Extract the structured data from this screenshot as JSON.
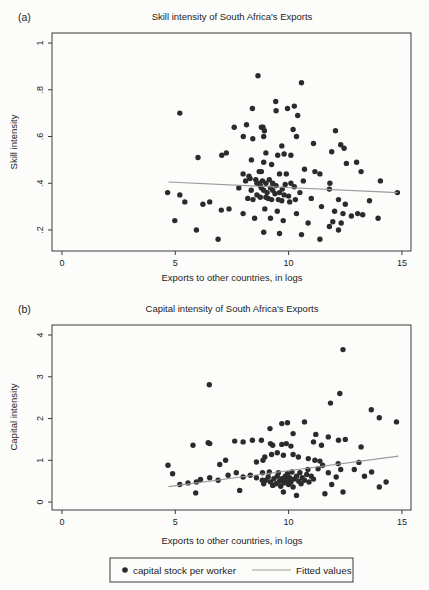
{
  "legend": {
    "marker_label": "capital stock per worker",
    "line_label": "Fitted values"
  },
  "colors": {
    "dot": "#2b2b2b",
    "fitted_line": "#9a9a9a",
    "axis": "#3a3a3a",
    "text": "#1c1c1c",
    "background": "#fcfcfb"
  },
  "chart_data": [
    {
      "type": "scatter",
      "panel_label": "(a)",
      "title": "Skill intensity of South Africa's Exports",
      "xlabel": "Exports to other countries, in logs",
      "ylabel": "Skill intensity",
      "grid": false,
      "legend_position": "bottom",
      "xlim": [
        -0.44,
        15.4
      ],
      "ylim": [
        0.11,
        1.043
      ],
      "xticks": [
        {
          "v": 0,
          "label": "0"
        },
        {
          "v": 5,
          "label": "5"
        },
        {
          "v": 10,
          "label": "10"
        },
        {
          "v": 15,
          "label": "15"
        }
      ],
      "yticks": [
        {
          "v": 1,
          "label": "1"
        },
        {
          "v": 0.8,
          "label": ".8"
        },
        {
          "v": 0.6,
          "label": ".6"
        },
        {
          "v": 0.4,
          "label": ".4"
        },
        {
          "v": 0.2,
          "label": ".2"
        }
      ],
      "fit_line": {
        "x1": 4.7,
        "y1": 0.405,
        "x2": 14.8,
        "y2": 0.36
      },
      "points": [
        [
          5.2,
          0.7
        ],
        [
          8.65,
          0.86
        ],
        [
          8.4,
          0.72
        ],
        [
          7.6,
          0.64
        ],
        [
          8.14,
          0.65
        ],
        [
          8.87,
          0.64
        ],
        [
          8.0,
          0.6
        ],
        [
          8.42,
          0.59
        ],
        [
          8.9,
          0.6
        ],
        [
          10.57,
          0.83
        ],
        [
          9.43,
          0.75
        ],
        [
          9.45,
          0.71
        ],
        [
          9.95,
          0.72
        ],
        [
          10.25,
          0.73
        ],
        [
          10.4,
          0.69
        ],
        [
          8.8,
          0.64
        ],
        [
          8.93,
          0.625
        ],
        [
          10.2,
          0.63
        ],
        [
          10.35,
          0.6
        ],
        [
          12.07,
          0.625
        ],
        [
          11.1,
          0.57
        ],
        [
          12.3,
          0.565
        ],
        [
          9.7,
          0.56
        ],
        [
          12.45,
          0.55
        ],
        [
          9.0,
          0.53
        ],
        [
          9.52,
          0.52
        ],
        [
          9.8,
          0.525
        ],
        [
          10.1,
          0.52
        ],
        [
          11.9,
          0.535
        ],
        [
          8.9,
          0.49
        ],
        [
          9.25,
          0.48
        ],
        [
          10.7,
          0.46
        ],
        [
          12.55,
          0.485
        ],
        [
          13.0,
          0.49
        ],
        [
          8.8,
          0.45
        ],
        [
          9.6,
          0.44
        ],
        [
          9.9,
          0.44
        ],
        [
          11.16,
          0.45
        ],
        [
          11.38,
          0.44
        ],
        [
          13.2,
          0.45
        ],
        [
          10.65,
          0.41
        ],
        [
          11.82,
          0.4
        ],
        [
          14.05,
          0.41
        ],
        [
          6.0,
          0.51
        ],
        [
          7.05,
          0.52
        ],
        [
          7.25,
          0.53
        ],
        [
          8.36,
          0.5
        ],
        [
          8.7,
          0.45
        ],
        [
          7.99,
          0.44
        ],
        [
          8.25,
          0.43
        ],
        [
          7.8,
          0.38
        ],
        [
          4.66,
          0.36
        ],
        [
          5.2,
          0.35
        ],
        [
          5.42,
          0.32
        ],
        [
          6.22,
          0.31
        ],
        [
          6.52,
          0.32
        ],
        [
          7.03,
          0.285
        ],
        [
          7.37,
          0.29
        ],
        [
          4.98,
          0.24
        ],
        [
          5.93,
          0.2
        ],
        [
          6.89,
          0.16
        ],
        [
          8.7,
          0.4
        ],
        [
          8.43,
          0.33
        ],
        [
          7.99,
          0.27
        ],
        [
          8.5,
          0.25
        ],
        [
          8.8,
          0.38
        ],
        [
          9.3,
          0.37
        ],
        [
          9.72,
          0.375
        ],
        [
          10.5,
          0.36
        ],
        [
          14.8,
          0.36
        ],
        [
          11.8,
          0.375
        ],
        [
          9.1,
          0.335
        ],
        [
          9.55,
          0.33
        ],
        [
          10.05,
          0.32
        ],
        [
          11.0,
          0.335
        ],
        [
          12.2,
          0.33
        ],
        [
          13.57,
          0.325
        ],
        [
          12.5,
          0.31
        ],
        [
          8.95,
          0.29
        ],
        [
          9.5,
          0.28
        ],
        [
          10.35,
          0.27
        ],
        [
          11.45,
          0.3
        ],
        [
          12.03,
          0.28
        ],
        [
          12.77,
          0.26
        ],
        [
          13.05,
          0.27
        ],
        [
          13.27,
          0.265
        ],
        [
          12.4,
          0.27
        ],
        [
          9.2,
          0.25
        ],
        [
          9.76,
          0.24
        ],
        [
          10.86,
          0.23
        ],
        [
          12.32,
          0.23
        ],
        [
          13.95,
          0.25
        ],
        [
          11.95,
          0.235
        ],
        [
          8.9,
          0.19
        ],
        [
          9.6,
          0.185
        ],
        [
          10.57,
          0.18
        ],
        [
          12.2,
          0.2
        ],
        [
          11.38,
          0.16
        ],
        [
          11.8,
          0.215
        ],
        [
          8.1,
          0.41
        ],
        [
          8.3,
          0.42
        ],
        [
          8.55,
          0.415
        ],
        [
          8.6,
          0.4
        ],
        [
          8.75,
          0.39
        ],
        [
          8.85,
          0.41
        ],
        [
          9.0,
          0.4
        ],
        [
          9.15,
          0.415
        ],
        [
          9.3,
          0.4
        ],
        [
          9.45,
          0.39
        ],
        [
          9.2,
          0.38
        ],
        [
          8.9,
          0.37
        ],
        [
          9.05,
          0.36
        ],
        [
          9.4,
          0.355
        ],
        [
          9.6,
          0.36
        ],
        [
          9.8,
          0.35
        ],
        [
          8.6,
          0.35
        ],
        [
          8.75,
          0.34
        ],
        [
          9.0,
          0.34
        ],
        [
          9.25,
          0.33
        ],
        [
          9.85,
          0.395
        ],
        [
          10.1,
          0.4
        ],
        [
          10.25,
          0.385
        ],
        [
          8.35,
          0.37
        ],
        [
          8.2,
          0.335
        ],
        [
          9.7,
          0.325
        ],
        [
          10.0,
          0.345
        ],
        [
          10.3,
          0.33
        ]
      ]
    },
    {
      "type": "scatter",
      "panel_label": "(b)",
      "title": "Capital intensity of South Africa's Exports",
      "xlabel": "Exports to other countries, in logs",
      "ylabel": "Capital intensity",
      "grid": false,
      "legend_position": "bottom",
      "xlim": [
        -0.44,
        15.4
      ],
      "ylim": [
        -0.19,
        4.24
      ],
      "xticks": [
        {
          "v": 0,
          "label": "0"
        },
        {
          "v": 5,
          "label": "5"
        },
        {
          "v": 10,
          "label": "10"
        },
        {
          "v": 15,
          "label": "15"
        }
      ],
      "yticks": [
        {
          "v": 4,
          "label": "4"
        },
        {
          "v": 3,
          "label": "3"
        },
        {
          "v": 2,
          "label": "2"
        },
        {
          "v": 1,
          "label": "1"
        },
        {
          "v": 0,
          "label": "0"
        }
      ],
      "fit_line": {
        "x1": 4.7,
        "y1": 0.37,
        "x2": 14.85,
        "y2": 1.1
      },
      "points": [
        [
          6.5,
          2.81
        ],
        [
          12.4,
          3.65
        ],
        [
          12.26,
          2.6
        ],
        [
          11.85,
          2.37
        ],
        [
          13.65,
          2.21
        ],
        [
          14.0,
          2.02
        ],
        [
          14.76,
          1.92
        ],
        [
          9.7,
          1.88
        ],
        [
          9.95,
          1.9
        ],
        [
          9.18,
          1.76
        ],
        [
          10.7,
          1.92
        ],
        [
          10.2,
          1.64
        ],
        [
          8.8,
          1.48
        ],
        [
          11.2,
          1.62
        ],
        [
          11.75,
          1.56
        ],
        [
          12.2,
          1.48
        ],
        [
          12.5,
          1.5
        ],
        [
          9.2,
          1.4
        ],
        [
          6.45,
          1.42
        ],
        [
          7.62,
          1.46
        ],
        [
          7.99,
          1.44
        ],
        [
          8.4,
          1.48
        ],
        [
          5.78,
          1.36
        ],
        [
          6.52,
          1.4
        ],
        [
          9.3,
          1.36
        ],
        [
          9.7,
          1.38
        ],
        [
          9.9,
          1.4
        ],
        [
          10.1,
          1.34
        ],
        [
          11.1,
          1.44
        ],
        [
          11.45,
          1.36
        ],
        [
          13.2,
          1.32
        ],
        [
          4.68,
          0.88
        ],
        [
          6.96,
          0.9
        ],
        [
          7.22,
          1.0
        ],
        [
          8.58,
          0.96
        ],
        [
          8.87,
          1.0
        ],
        [
          8.95,
          1.08
        ],
        [
          9.25,
          1.14
        ],
        [
          9.5,
          1.18
        ],
        [
          9.77,
          1.12
        ],
        [
          10.2,
          1.14
        ],
        [
          10.43,
          1.08
        ],
        [
          10.87,
          1.04
        ],
        [
          11.16,
          1.0
        ],
        [
          11.38,
          0.98
        ],
        [
          12.19,
          0.92
        ],
        [
          13.66,
          0.72
        ],
        [
          12.9,
          0.78
        ],
        [
          13.1,
          0.95
        ],
        [
          13.35,
          0.62
        ],
        [
          14.3,
          0.48
        ],
        [
          4.88,
          0.68
        ],
        [
          5.2,
          0.42
        ],
        [
          5.56,
          0.46
        ],
        [
          5.93,
          0.48
        ],
        [
          6.11,
          0.54
        ],
        [
          6.52,
          0.58
        ],
        [
          6.89,
          0.52
        ],
        [
          7.33,
          0.64
        ],
        [
          7.69,
          0.7
        ],
        [
          7.99,
          0.6
        ],
        [
          8.31,
          0.64
        ],
        [
          8.58,
          0.58
        ],
        [
          8.84,
          0.52
        ],
        [
          7.84,
          0.28
        ],
        [
          5.9,
          0.22
        ],
        [
          8.9,
          0.44
        ],
        [
          9.0,
          0.52
        ],
        [
          9.1,
          0.6
        ],
        [
          9.2,
          0.48
        ],
        [
          9.3,
          0.4
        ],
        [
          9.35,
          0.56
        ],
        [
          9.45,
          0.44
        ],
        [
          9.5,
          0.62
        ],
        [
          9.6,
          0.5
        ],
        [
          9.65,
          0.38
        ],
        [
          9.7,
          0.56
        ],
        [
          9.8,
          0.46
        ],
        [
          9.85,
          0.62
        ],
        [
          9.9,
          0.52
        ],
        [
          10.0,
          0.42
        ],
        [
          10.05,
          0.58
        ],
        [
          10.1,
          0.48
        ],
        [
          10.2,
          0.36
        ],
        [
          10.25,
          0.55
        ],
        [
          10.35,
          0.62
        ],
        [
          10.45,
          0.5
        ],
        [
          10.55,
          0.44
        ],
        [
          10.6,
          0.58
        ],
        [
          10.7,
          0.52
        ],
        [
          10.8,
          0.66
        ],
        [
          10.9,
          0.48
        ],
        [
          8.85,
          0.7
        ],
        [
          9.15,
          0.72
        ],
        [
          9.55,
          0.7
        ],
        [
          9.95,
          0.68
        ],
        [
          10.15,
          0.72
        ],
        [
          10.5,
          0.7
        ],
        [
          10.85,
          0.78
        ],
        [
          11.0,
          0.62
        ],
        [
          11.1,
          0.55
        ],
        [
          11.3,
          0.8
        ],
        [
          11.5,
          0.88
        ],
        [
          11.6,
          0.2
        ],
        [
          12.4,
          0.24
        ],
        [
          10.35,
          0.16
        ],
        [
          9.77,
          0.24
        ],
        [
          14.0,
          0.36
        ],
        [
          11.9,
          0.42
        ],
        [
          12.1,
          0.6
        ],
        [
          11.75,
          0.7
        ],
        [
          12.3,
          0.78
        ]
      ]
    }
  ]
}
